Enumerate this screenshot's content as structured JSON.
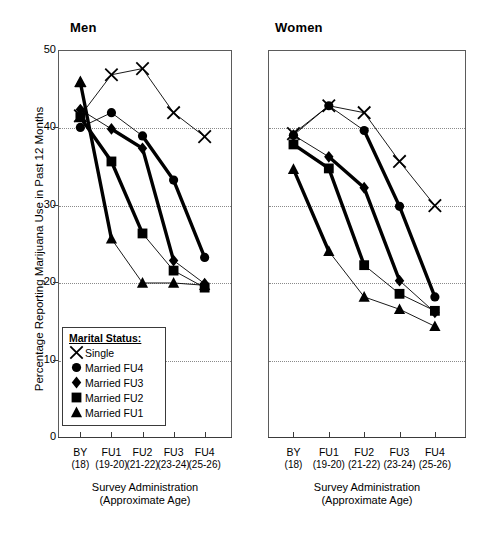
{
  "figure": {
    "y_axis_label": "Percentage Reporting Marijuana Use in Past 12 Months",
    "x_axis_caption_line1": "Survey Administration",
    "x_axis_caption_line2": "(Approximate Age)"
  },
  "legend": {
    "title": "Marital Status:",
    "entries": [
      {
        "label": "Single",
        "symbol": "x-marker-icon"
      },
      {
        "label": "Married FU4",
        "symbol": "circle-marker-icon"
      },
      {
        "label": "Married FU3",
        "symbol": "diamond-marker-icon"
      },
      {
        "label": "Married FU2",
        "symbol": "square-marker-icon"
      },
      {
        "label": "Married FU1",
        "symbol": "triangle-marker-icon"
      }
    ]
  },
  "chart_data": {
    "type": "line",
    "title": "",
    "xlabel": "Survey Administration (Approximate Age)",
    "ylabel": "Percentage Reporting Marijuana Use in Past 12 Months",
    "ylim": [
      0,
      50
    ],
    "yticks": [
      0,
      10,
      20,
      30,
      40,
      50
    ],
    "gridlines": [
      10,
      20,
      30,
      40
    ],
    "grid": true,
    "legend_position": "inside-lower-left-of-left-panel",
    "categories": [
      "BY",
      "FU1",
      "FU2",
      "FU3",
      "FU4"
    ],
    "category_ages": [
      "(18)",
      "(19-20)",
      "(21-22)",
      "(23-24)",
      "(25-26)"
    ],
    "panels": [
      {
        "name": "Men",
        "series": [
          {
            "name": "Single",
            "marker": "x",
            "emphasis": "thin",
            "values": [
              41.5,
              46.8,
              47.6,
              41.9,
              38.8
            ]
          },
          {
            "name": "Married FU4",
            "marker": "circle",
            "emphasis": "thin",
            "values": [
              40.0,
              41.9,
              38.9,
              33.2,
              23.2
            ],
            "thick_from_index": 2
          },
          {
            "name": "Married FU3",
            "marker": "diamond",
            "emphasis": "thin",
            "values": [
              42.3,
              39.8,
              37.3,
              22.8,
              19.8
            ],
            "thick_from_index": 1,
            "thick_to_index": 3
          },
          {
            "name": "Married FU2",
            "marker": "square",
            "emphasis": "thin",
            "values": [
              41.3,
              35.6,
              26.3,
              21.5,
              19.3
            ],
            "thick_from_index": 0,
            "thick_to_index": 2
          },
          {
            "name": "Married FU1",
            "marker": "triangle",
            "emphasis": "thick",
            "values": [
              45.8,
              25.6,
              19.9,
              19.9,
              19.6
            ],
            "thick_from_index": 0,
            "thick_to_index": 1
          }
        ]
      },
      {
        "name": "Women",
        "series": [
          {
            "name": "Single",
            "marker": "x",
            "emphasis": "thin",
            "values": [
              39.2,
              42.8,
              41.9,
              35.6,
              29.9
            ]
          },
          {
            "name": "Married FU4",
            "marker": "circle",
            "emphasis": "thin",
            "values": [
              39.0,
              42.8,
              39.6,
              29.8,
              18.1
            ],
            "thick_from_index": 2
          },
          {
            "name": "Married FU3",
            "marker": "diamond",
            "emphasis": "thin",
            "values": [
              39.0,
              36.2,
              32.2,
              20.2,
              16.1
            ],
            "thick_from_index": 1,
            "thick_to_index": 3
          },
          {
            "name": "Married FU2",
            "marker": "square",
            "emphasis": "thin",
            "values": [
              37.8,
              34.7,
              22.2,
              18.5,
              16.3
            ],
            "thick_from_index": 0,
            "thick_to_index": 2
          },
          {
            "name": "Married FU1",
            "marker": "triangle",
            "emphasis": "thick",
            "values": [
              34.6,
              24.0,
              18.1,
              16.5,
              14.3
            ],
            "thick_from_index": 0,
            "thick_to_index": 1
          }
        ]
      }
    ]
  }
}
